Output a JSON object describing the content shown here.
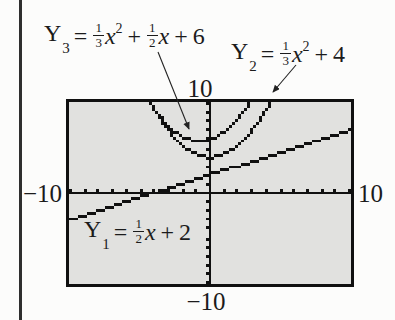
{
  "figure": {
    "labels": {
      "y3": {
        "base": "Y",
        "sub": "3",
        "eq": "=",
        "frac1_num": "1",
        "frac1_den": "3",
        "var1": "x",
        "exp1": "2",
        "plus1": "+",
        "frac2_num": "1",
        "frac2_den": "2",
        "var2": "x",
        "plus2": "+",
        "const": "6"
      },
      "y2": {
        "base": "Y",
        "sub": "2",
        "eq": "=",
        "frac1_num": "1",
        "frac1_den": "3",
        "var1": "x",
        "exp1": "2",
        "plus1": "+",
        "const": "4"
      },
      "y1": {
        "base": "Y",
        "sub": "1",
        "eq": "=",
        "frac1_num": "1",
        "frac1_den": "2",
        "var1": "x",
        "plus1": "+",
        "const": "2"
      }
    },
    "axis_labels": {
      "top": "10",
      "right": "10",
      "left": "−10",
      "bottom": "−10"
    }
  },
  "chart_data": {
    "type": "line",
    "window": {
      "xmin": -10,
      "xmax": 10,
      "ymin": -10,
      "ymax": 10,
      "xscl": 1,
      "yscl": 1
    },
    "screen_pixels": {
      "cols": 95,
      "rows": 63
    },
    "series": [
      {
        "name": "Y1",
        "label": "Y1 = (1/2)x + 2",
        "form": "linear",
        "coefficients": {
          "a": 0,
          "b": 0.5,
          "c": 2
        }
      },
      {
        "name": "Y2",
        "label": "Y2 = (1/3)x^2 + 4",
        "form": "quadratic",
        "coefficients": {
          "a": 0.3333333,
          "b": 0,
          "c": 4
        }
      },
      {
        "name": "Y3",
        "label": "Y3 = (1/3)x^2 + (1/2)x + 6",
        "form": "quadratic",
        "coefficients": {
          "a": 0.3333333,
          "b": 0.5,
          "c": 6
        }
      }
    ],
    "legend_position": "annotated-arrows",
    "grid": false
  },
  "colors": {
    "ink": "#101010",
    "screen_bg": "#e1e1df",
    "page_bg": "#fcfcfb",
    "text": "#1b1b1b",
    "rule": "#2e2e2e"
  }
}
